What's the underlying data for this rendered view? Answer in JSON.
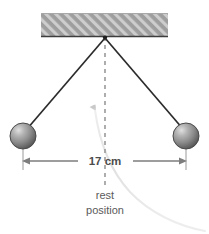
{
  "figure": {
    "background_color": "#ffffff",
    "width": 209,
    "height": 234
  },
  "ceiling": {
    "name": "hatched ceiling support",
    "fill_color": "#9e9e9e",
    "hatch_color": "#cfcfcf",
    "edge_color": "#3d3d3d",
    "x": 41,
    "y": 13,
    "width": 127,
    "height": 24
  },
  "pivot": {
    "name": "pivot point",
    "x": 105,
    "y": 37,
    "color": "#2b2b2b"
  },
  "strings": {
    "color": "#2b2b2b",
    "left": {
      "x1": 105,
      "y1": 37,
      "x2": 27,
      "y2": 128
    },
    "right": {
      "x1": 105,
      "y1": 37,
      "x2": 183,
      "y2": 128
    }
  },
  "bobs": [
    {
      "name": "left-pendulum-bob",
      "cx": 23,
      "cy": 136,
      "r": 13,
      "fill_light": "#d8d8d8",
      "fill_mid": "#8f8f8f",
      "fill_dark": "#555555",
      "edge_color": "#4a4a4a"
    },
    {
      "name": "right-pendulum-bob",
      "cx": 186,
      "cy": 136,
      "r": 13,
      "fill_light": "#d8d8d8",
      "fill_mid": "#8f8f8f",
      "fill_dark": "#555555",
      "edge_color": "#4a4a4a"
    }
  ],
  "rest_line": {
    "name": "rest position dashed centerline",
    "x": 105,
    "y_top": 37,
    "y_bottom": 186,
    "color": "#9a9a9a",
    "dash": "4 4"
  },
  "dimension": {
    "name": "width dimension 17 cm",
    "label": "17 cm",
    "y": 161,
    "x_left": 23,
    "x_right": 186,
    "line_color": "#7d7d7d",
    "text_color": "#4c4c4c",
    "extension_color": "#9a9a9a"
  },
  "rest_caption": {
    "line1": "rest",
    "line2": "position",
    "x": 105,
    "y1": 199,
    "y2": 214,
    "color": "#5a5a5a"
  },
  "swing_arc": {
    "name": "faint swing path arc",
    "color": "#e2e2e2",
    "arrow_color": "#c9c9c9",
    "arrow_tip_x": 92,
    "arrow_tip_y": 107
  }
}
